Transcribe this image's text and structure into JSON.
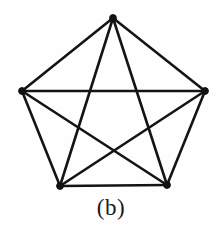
{
  "figure": {
    "caption": "(b)",
    "background_color": "#fefefe",
    "line_color": "#141414",
    "vertex_color": "#121212",
    "line_width_px": 2.6,
    "vertex_radius_px": 3.4
  },
  "graph_data": {
    "type": "graph",
    "name": "K5",
    "vertex_count": 5,
    "edge_count": 10,
    "vertices": [
      {
        "id": "v1",
        "label": "top",
        "x": 113,
        "y": 18
      },
      {
        "id": "v2",
        "label": "right",
        "x": 205,
        "y": 91
      },
      {
        "id": "v3",
        "label": "bottom-right",
        "x": 167,
        "y": 185
      },
      {
        "id": "v4",
        "label": "bottom-left",
        "x": 60,
        "y": 186
      },
      {
        "id": "v5",
        "label": "left",
        "x": 22,
        "y": 91
      }
    ],
    "edges": [
      {
        "from": "v1",
        "to": "v2",
        "kind": "side"
      },
      {
        "from": "v2",
        "to": "v3",
        "kind": "side"
      },
      {
        "from": "v3",
        "to": "v4",
        "kind": "side"
      },
      {
        "from": "v4",
        "to": "v5",
        "kind": "side"
      },
      {
        "from": "v5",
        "to": "v1",
        "kind": "side"
      },
      {
        "from": "v1",
        "to": "v3",
        "kind": "diagonal"
      },
      {
        "from": "v1",
        "to": "v4",
        "kind": "diagonal"
      },
      {
        "from": "v2",
        "to": "v4",
        "kind": "diagonal"
      },
      {
        "from": "v2",
        "to": "v5",
        "kind": "diagonal"
      },
      {
        "from": "v3",
        "to": "v5",
        "kind": "diagonal"
      }
    ]
  }
}
